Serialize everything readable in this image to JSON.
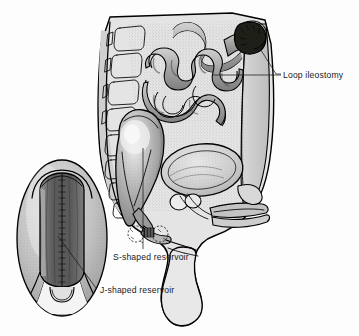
{
  "figure": {
    "kind": "medical-illustration",
    "view": "male pelvis sagittal cross-section",
    "background_color": "#fdfdfd",
    "ink_color": "#000000",
    "palette": {
      "paper": "#fdfdfd",
      "body_fill": "#e2e2e2",
      "abdominal_wall": "#c9c9c9",
      "bowel_mid": "#b2b2b2",
      "bowel_dark": "#8d8d8d",
      "reservoir_fill": "#a8a8a8",
      "reservoir_highlight": "#dedede",
      "bladder_fill": "#d6d6d6",
      "stoma_dark": "#15150f",
      "inset_outer": "#c6c6c6",
      "inset_inner": "#6f6f6f",
      "leader_line": "#1a1a1a",
      "text": "#1a1a1a"
    }
  },
  "labels": [
    {
      "id": "loop-ileostomy",
      "text": "Loop ileostomy",
      "x": 283,
      "y": 79,
      "anchor": "start",
      "target_x": 236,
      "target_y": 75,
      "points_to": "stoma on anterior abdominal wall"
    },
    {
      "id": "s-shaped-reservoir",
      "text": "S-shaped reservoir",
      "x": 113,
      "y": 258,
      "anchor": "start",
      "target_x": 143,
      "target_y": 148,
      "points_to": "ileal pouch in pelvis"
    },
    {
      "id": "j-shaped-reservoir",
      "text": "J-shaped reservoir",
      "x": 101,
      "y": 292,
      "anchor": "start",
      "target_x": 60,
      "target_y": 240,
      "points_to": "inset detail of J pouch"
    }
  ],
  "structures": [
    {
      "id": "vertebral-column",
      "name": "Vertebral column / sacrum"
    },
    {
      "id": "small-intestine",
      "name": "Coiled small intestine loops"
    },
    {
      "id": "loop-ileostomy-stoma",
      "name": "Loop ileostomy stoma"
    },
    {
      "id": "s-pouch-reservoir",
      "name": "S-shaped ileal reservoir"
    },
    {
      "id": "urinary-bladder",
      "name": "Urinary bladder"
    },
    {
      "id": "prostate",
      "name": "Prostate"
    },
    {
      "id": "penis",
      "name": "Penis"
    },
    {
      "id": "scrotum",
      "name": "Scrotum"
    },
    {
      "id": "anal-canal",
      "name": "Anal canal / anastomosis"
    },
    {
      "id": "abdominal-wall",
      "name": "Anterior abdominal wall"
    },
    {
      "id": "j-pouch-inset",
      "name": "J-shaped reservoir inset"
    }
  ]
}
